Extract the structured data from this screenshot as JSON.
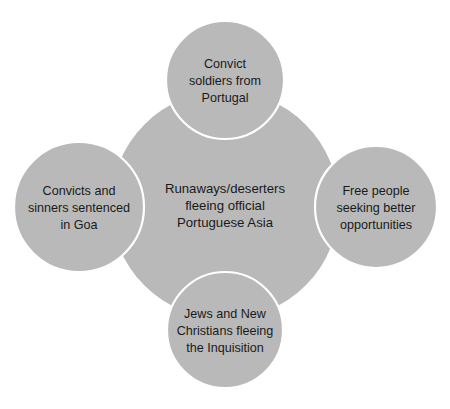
{
  "diagram": {
    "type": "cluster-bubble-diagram",
    "background_color": "#ffffff",
    "bubble_fill_color": "#b9b9b9",
    "bubble_stroke_color": "#ffffff",
    "text_color": "#1a1a1a",
    "center": {
      "id": "center-bubble",
      "label": "Runaways/deserters fleeing official Portuguese Asia",
      "lines": [
        "Runaways/deserters",
        "fleeing official",
        "Portuguese Asia"
      ]
    },
    "satellites": [
      {
        "id": "top-bubble",
        "position": "top",
        "label": "Convict soldiers from Portugal",
        "lines": [
          "Convict",
          "soldiers from",
          "Portugal"
        ]
      },
      {
        "id": "left-bubble",
        "position": "left",
        "label": "Convicts and sinners sentenced in Goa",
        "lines": [
          "Convicts and",
          "sinners sentenced",
          "in Goa"
        ]
      },
      {
        "id": "right-bubble",
        "position": "right",
        "label": "Free people seeking better opportunities",
        "lines": [
          "Free people",
          "seeking better",
          "opportunities"
        ]
      },
      {
        "id": "bottom-bubble",
        "position": "bottom",
        "label": "Jews and New Christians fleeing the Inquisition",
        "lines": [
          "Jews and New",
          "Christians fleeing",
          "the Inquisition"
        ]
      }
    ]
  }
}
